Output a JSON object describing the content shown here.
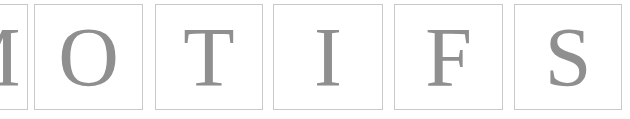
{
  "canvas": {
    "width": 630,
    "height": 119,
    "background": "#ffffff"
  },
  "word": "MOTIFS",
  "style": {
    "glyph_color": "#8f8f8f",
    "box_border_color": "#c9c9c9",
    "box_fill": "#ffffff",
    "box_border_width": 1,
    "glyph_font_size_px": 84
  },
  "letter_boxes": [
    {
      "letter": "M",
      "index": 0,
      "x": -62,
      "y": 4,
      "width": 90,
      "height": 106,
      "clipped": "left",
      "font_size": 84
    },
    {
      "letter": "O",
      "index": 1,
      "x": 34,
      "y": 4,
      "width": 109,
      "height": 106,
      "clipped": "none",
      "font_size": 84
    },
    {
      "letter": "T",
      "index": 2,
      "x": 155,
      "y": 4,
      "width": 108,
      "height": 106,
      "clipped": "none",
      "font_size": 84
    },
    {
      "letter": "I",
      "index": 3,
      "x": 273,
      "y": 4,
      "width": 110,
      "height": 106,
      "clipped": "none",
      "font_size": 84
    },
    {
      "letter": "F",
      "index": 4,
      "x": 394,
      "y": 4,
      "width": 109,
      "height": 106,
      "clipped": "none",
      "font_size": 84
    },
    {
      "letter": "S",
      "index": 5,
      "x": 514,
      "y": 4,
      "width": 108,
      "height": 106,
      "clipped": "none",
      "font_size": 84
    }
  ]
}
